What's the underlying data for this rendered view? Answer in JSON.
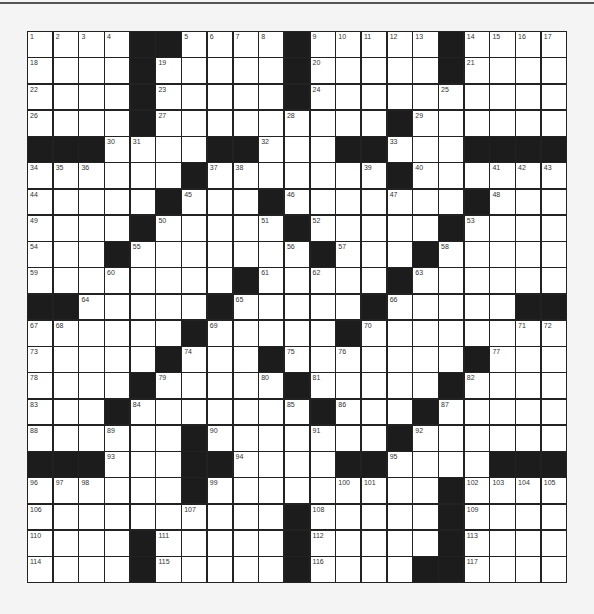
{
  "puzzle": {
    "rows": 21,
    "cols": 21,
    "grid": [
      "1,2,3,4,#,#,5,6,7,8,#,9,10,11,12,13,#,14,15,16,17",
      "18,.,.,.,#,19,.,.,.,.,#,20,.,.,.,.,#,21,.,.,.",
      "22,.,.,.,#,23,.,.,.,.,#,24,.,.,.,.,25,.,.,.,.",
      "26,.,.,.,#,27,.,.,.,.,28,.,.,.,#,29,.,.,.,.,.",
      "#,#,#,30,31,.,.,#,#,32,.,.,#,#,33,.,.,#,#,#,#",
      "34,35,36,.,.,.,#,37,38,.,.,.,.,39,#,40,.,.,41,42,43",
      "44,.,.,.,.,#,45,.,.,#,46,.,.,.,47,.,.,#,48,.,.",
      "49,.,.,.,#,50,.,.,.,51,#,52,.,.,.,.,#,53,.,.,.",
      "54,.,.,#,55,.,.,.,.,.,56,#,57,.,.,#,58,.,.,.,.",
      "59,.,.,60,.,.,.,.,#,61,.,62,.,.,#,63,.,.,.,.,.",
      "#,#,64,.,.,.,.,#,65,.,.,.,.,#,66,.,.,.,.,#,#",
      "67,68,.,.,.,.,#,69,.,.,.,.,#,70,.,.,.,.,.,71,72",
      "73,.,.,.,.,#,74,.,.,#,75,.,76,.,.,.,.,#,77,.,.",
      "78,.,.,.,#,79,.,.,.,80,#,81,.,.,.,.,#,82,.,.,.",
      "83,.,.,#,84,.,.,.,.,.,85,#,86,.,.,#,87,.,.,.,.",
      "88,.,.,89,.,.,#,90,.,.,.,91,.,.,#,92,.,.,.,.,.",
      "#,#,#,93,.,.,#,#,94,.,.,.,#,#,95,.,.,.,#,#,#",
      "96,97,98,.,.,.,#,99,.,.,.,.,100,101,.,.,#,102,103,104,105",
      "106,.,.,.,.,.,107,.,.,.,#,108,.,.,.,.,#,109,.,.,.",
      "110,.,.,.,#,111,.,.,.,.,#,112,.,.,.,.,#,113,.,.,.",
      "114,.,.,.,#,115,.,.,.,.,#,116,.,.,.,#,#,117,.,.,."
    ]
  },
  "colors": {
    "black_square": "#1c1c1c",
    "white_square": "#ffffff",
    "grid_line": "#222222",
    "page_background": "#f4f4f4"
  }
}
